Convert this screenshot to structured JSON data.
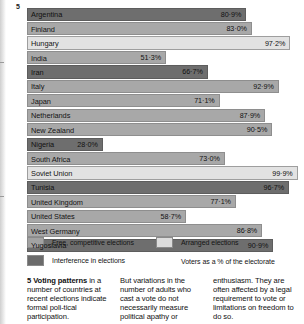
{
  "figure": {
    "number": "5",
    "title": "Voting patterns"
  },
  "chart_data": {
    "type": "bar",
    "orientation": "horizontal",
    "title": "Voting patterns in a number of countries at recent elections",
    "xlabel": "Voters as a % of the electorate",
    "ylabel": "",
    "xlim": [
      0,
      100
    ],
    "grid": false,
    "legend_position": "below-chart",
    "categories": [
      "Argentina",
      "Finland",
      "Hungary",
      "India",
      "Iran",
      "Italy",
      "Japan",
      "Netherlands",
      "New Zealand",
      "Nigeria",
      "South Africa",
      "Soviet Union",
      "Tunisia",
      "United Kingdom",
      "United States",
      "West Germany",
      "Yugoslavia"
    ],
    "values": [
      80.9,
      83.0,
      97.2,
      51.3,
      66.7,
      92.9,
      71.1,
      87.9,
      90.5,
      28.0,
      73.0,
      99.9,
      96.7,
      77.1,
      58.7,
      86.8,
      90.9
    ],
    "value_labels": [
      "80·9%",
      "83·0%",
      "97·2%",
      "51·3%",
      "66·7%",
      "92·9%",
      "71·1%",
      "87·9%",
      "90·5%",
      "28·0%",
      "73·0%",
      "99·9%",
      "96·7%",
      "77·1%",
      "58·7%",
      "86·8%",
      "90·9%"
    ],
    "series_types": [
      "interference",
      "free",
      "arranged",
      "free",
      "interference",
      "free",
      "free",
      "free",
      "free",
      "interference",
      "free",
      "arranged",
      "interference",
      "free",
      "free",
      "free",
      "interference"
    ],
    "legend": [
      {
        "key": "free",
        "label": "Free, competitive elections"
      },
      {
        "key": "arranged",
        "label": "Arranged elections"
      },
      {
        "key": "interference",
        "label": "Interference in elections"
      }
    ],
    "axis_note": "Voters as a % of the electorate",
    "colors": {
      "free": "#a8a8a8",
      "interference": "#6e6e6e",
      "arranged": "#e2e2e2",
      "outline": "#8a8a8a",
      "background": "#ffffff",
      "text": "#111111"
    }
  },
  "caption": {
    "columns": [
      {
        "lead_number": "5",
        "lead_bold": "Voting patterns",
        "rest": " in a number of countries at recent elections indicate formal poli-tical participation."
      },
      {
        "text": "But variations in the number of adults who cast a vote do not necessarily measure political apathy or"
      },
      {
        "text": "enthusiasm. They are often affected by a legal requirement to vote or limitations on freedom to do so."
      }
    ]
  }
}
